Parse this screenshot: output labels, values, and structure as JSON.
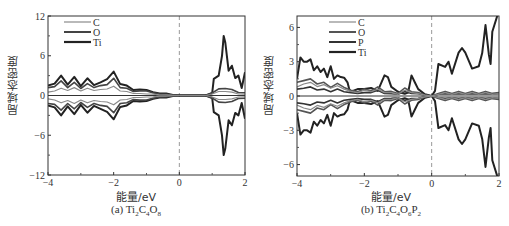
{
  "chart_data": [
    {
      "type": "line",
      "panel": "a",
      "caption_prefix": "(a) Ti",
      "caption": "(a) Ti2C4O8",
      "formula": [
        [
          "Ti",
          "2"
        ],
        [
          "C",
          "4"
        ],
        [
          "O",
          "8"
        ]
      ],
      "title": "",
      "xlabel": "能量/eV",
      "ylabel": "局域态密度",
      "xlim": [
        -4,
        2
      ],
      "ylim": [
        -12,
        12
      ],
      "xticks": [
        -4,
        -2,
        0,
        2
      ],
      "yticks": [
        -12,
        -6,
        0,
        6,
        12
      ],
      "fermi_level_line": 0,
      "legend": [
        "C",
        "O",
        "Ti"
      ],
      "legend_position": "upper left",
      "series": [
        {
          "name": "C",
          "color": "#8a8a8a",
          "x": [
            -4,
            -3.8,
            -3.6,
            -3.4,
            -3.2,
            -3,
            -2.8,
            -2.6,
            -2.4,
            -2.2,
            -2,
            -1.8,
            -1.6,
            -1.4,
            -1.2,
            -1,
            -0.8,
            -0.6,
            -0.4,
            -0.2,
            0,
            0.2,
            0.4,
            0.6,
            0.8,
            1,
            1.2,
            1.4,
            1.6,
            1.8,
            2
          ],
          "values": [
            0.5,
            0.9,
            1.1,
            1.0,
            1.2,
            0.9,
            1.1,
            1.0,
            0.9,
            1.3,
            1.4,
            0.9,
            0.6,
            0.4,
            0.3,
            0.3,
            0.2,
            0.1,
            0.1,
            0.05,
            0,
            0,
            0,
            0,
            0,
            0.3,
            0.6,
            0.8,
            0.5,
            0.3,
            0.2
          ]
        },
        {
          "name": "O",
          "color": "#444444",
          "x": [
            -4,
            -3.8,
            -3.6,
            -3.4,
            -3.2,
            -3,
            -2.8,
            -2.6,
            -2.4,
            -2.2,
            -2,
            -1.8,
            -1.6,
            -1.4,
            -1.2,
            -1,
            -0.8,
            -0.6,
            -0.4,
            -0.2,
            0,
            0.2,
            0.4,
            0.6,
            0.8,
            1,
            1.2,
            1.4,
            1.6,
            1.8,
            2
          ],
          "values": [
            1.2,
            1.8,
            2.2,
            1.6,
            2.0,
            1.4,
            1.8,
            1.6,
            1.5,
            2.2,
            2.6,
            1.6,
            1.1,
            0.8,
            0.7,
            0.9,
            0.4,
            0.3,
            0.2,
            0.1,
            0,
            0,
            0,
            0,
            0,
            0.5,
            1.0,
            1.4,
            0.9,
            0.6,
            0.4
          ]
        },
        {
          "name": "Ti",
          "color": "#222222",
          "x": [
            -4,
            -3.8,
            -3.6,
            -3.4,
            -3.2,
            -3,
            -2.8,
            -2.6,
            -2.4,
            -2.2,
            -2,
            -1.8,
            -1.6,
            -1.4,
            -1.2,
            -1,
            -0.8,
            -0.6,
            -0.4,
            -0.2,
            0,
            0.2,
            0.4,
            0.6,
            0.8,
            1,
            1.05,
            1.2,
            1.3,
            1.35,
            1.4,
            1.5,
            1.6,
            1.7,
            1.8,
            1.9,
            2
          ],
          "values": [
            1.5,
            2.4,
            3.0,
            2.2,
            2.8,
            1.9,
            2.6,
            2.1,
            2.0,
            3.3,
            3.6,
            2.3,
            1.5,
            1.1,
            0.9,
            1.1,
            0.5,
            0.4,
            0.3,
            0.1,
            0,
            0,
            0,
            0,
            0,
            0.5,
            2.5,
            4.0,
            6.0,
            12,
            8.0,
            5.0,
            4.5,
            3.5,
            3.0,
            1.5,
            3.5
          ]
        }
      ],
      "spin_symmetric": true
    },
    {
      "type": "line",
      "panel": "b",
      "caption": "(b) Ti2C4O6P2",
      "formula": [
        [
          "Ti",
          "2"
        ],
        [
          "C",
          "4"
        ],
        [
          "O",
          "6"
        ],
        [
          "P",
          "2"
        ]
      ],
      "title": "",
      "xlabel": "能量/eV",
      "ylabel": "局域态密度",
      "xlim": [
        -4,
        2
      ],
      "ylim": [
        -7,
        7
      ],
      "xticks": [
        -4,
        -2,
        0,
        2
      ],
      "yticks": [
        -6,
        -3,
        0,
        3,
        6
      ],
      "fermi_level_line": 0,
      "legend": [
        "C",
        "O",
        "P",
        "Ti"
      ],
      "legend_position": "upper left",
      "series": [
        {
          "name": "C",
          "color": "#8a8a8a",
          "x": [
            -4,
            -3.8,
            -3.6,
            -3.4,
            -3.2,
            -3,
            -2.8,
            -2.6,
            -2.4,
            -2.2,
            -2,
            -1.8,
            -1.6,
            -1.4,
            -1.2,
            -1,
            -0.8,
            -0.6,
            -0.4,
            -0.2,
            0,
            0.2,
            0.4,
            0.6,
            0.8,
            1,
            1.2,
            1.4,
            1.6,
            1.8,
            2
          ],
          "values": [
            0.8,
            1.4,
            1.2,
            1.1,
            1.0,
            0.9,
            0.9,
            0.8,
            0.4,
            0.4,
            0.5,
            0.5,
            0.6,
            0.4,
            0.3,
            0.2,
            0.5,
            0.4,
            0.2,
            0.1,
            0,
            0.2,
            0.3,
            0.2,
            0.3,
            0.2,
            0.3,
            0.2,
            0.3,
            0.2,
            0.2
          ]
        },
        {
          "name": "O",
          "color": "#555555",
          "x": [
            -4,
            -3.8,
            -3.6,
            -3.4,
            -3.2,
            -3,
            -2.8,
            -2.6,
            -2.4,
            -2.2,
            -2,
            -1.8,
            -1.6,
            -1.4,
            -1.2,
            -1,
            -0.8,
            -0.6,
            -0.4,
            -0.2,
            0,
            0.2,
            0.4,
            0.6,
            0.8,
            1,
            1.2,
            1.4,
            1.6,
            1.8,
            2
          ],
          "values": [
            1.2,
            1.8,
            1.5,
            1.4,
            1.2,
            1.0,
            1.1,
            1.0,
            0.5,
            0.5,
            0.6,
            0.6,
            0.8,
            0.5,
            0.4,
            0.3,
            0.7,
            0.5,
            0.3,
            0.1,
            0,
            0.3,
            0.4,
            0.3,
            0.4,
            0.3,
            0.4,
            0.3,
            0.4,
            0.3,
            0.3
          ]
        },
        {
          "name": "P",
          "color": "#333333",
          "x": [
            -4,
            -3.8,
            -3.6,
            -3.4,
            -3.2,
            -3,
            -2.8,
            -2.6,
            -2.4,
            -2.2,
            -2,
            -1.8,
            -1.6,
            -1.4,
            -1.2,
            -1,
            -0.8,
            -0.6,
            -0.4,
            -0.2,
            0,
            0.2,
            0.4,
            0.6,
            0.8,
            1,
            1.2,
            1.4,
            1.6,
            1.8,
            2
          ],
          "values": [
            0.6,
            0.9,
            0.8,
            0.7,
            0.6,
            0.5,
            0.6,
            0.5,
            0.3,
            0.3,
            0.3,
            0.4,
            0.5,
            0.3,
            0.2,
            0.2,
            0.4,
            0.3,
            0.2,
            0.1,
            0,
            0.2,
            0.2,
            0.2,
            0.2,
            0.2,
            0.2,
            0.2,
            0.2,
            0.2,
            0.2
          ]
        },
        {
          "name": "Ti",
          "color": "#222222",
          "x": [
            -4,
            -3.9,
            -3.8,
            -3.7,
            -3.6,
            -3.5,
            -3.4,
            -3.3,
            -3.2,
            -3.1,
            -3,
            -2.9,
            -2.8,
            -2.7,
            -2.6,
            -2.5,
            -2.45,
            -2.4,
            -2.2,
            -2,
            -1.8,
            -1.6,
            -1.4,
            -1.3,
            -1.2,
            -1.0,
            -0.8,
            -0.7,
            -0.6,
            -0.5,
            -0.4,
            -0.2,
            0,
            0.1,
            0.2,
            0.4,
            0.5,
            0.6,
            0.8,
            0.9,
            1.0,
            1.2,
            1.4,
            1.5,
            1.6,
            1.7,
            1.75,
            1.8,
            2
          ],
          "values": [
            1.5,
            4.5,
            3.0,
            4.0,
            3.2,
            3.0,
            2.6,
            2.8,
            2.4,
            2.2,
            2.6,
            2.0,
            1.8,
            2.2,
            1.6,
            1.6,
            0.6,
            0.5,
            0.6,
            0.8,
            0.7,
            0.6,
            1.8,
            2.2,
            0.8,
            0.5,
            0.2,
            0.4,
            1.8,
            1.6,
            0.6,
            0.2,
            0,
            0.6,
            2.8,
            3.4,
            3.0,
            2.6,
            3.8,
            5.6,
            3.8,
            3.2,
            2.6,
            5.0,
            6.2,
            4.8,
            2.8,
            7.5,
            7.5
          ]
        }
      ],
      "spin_symmetric": true
    }
  ]
}
